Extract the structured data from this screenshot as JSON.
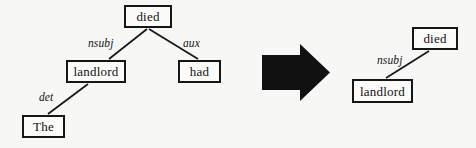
{
  "figure": {
    "type": "dependency-parse-transformation",
    "background_color": "#f7f7f5",
    "node_border_color": "#161616",
    "node_fill_color": "#fbfbf9",
    "edge_color": "#161616",
    "arrow_color": "#111111",
    "width": 476,
    "height": 148
  },
  "left_tree": {
    "caption": "full dependency tree",
    "nodes": [
      {
        "id": "died",
        "label": "died",
        "x": 124,
        "y": 5,
        "w": 48,
        "h": 23
      },
      {
        "id": "landlord",
        "label": "landlord",
        "x": 66,
        "y": 60,
        "w": 60,
        "h": 23
      },
      {
        "id": "had",
        "label": "had",
        "x": 178,
        "y": 60,
        "w": 43,
        "h": 23
      },
      {
        "id": "the",
        "label": "The",
        "x": 22,
        "y": 115,
        "w": 43,
        "h": 23
      }
    ],
    "edges": [
      {
        "from": "died",
        "to": "landlord",
        "label": "nsubj",
        "label_x": 88,
        "label_y": 38
      },
      {
        "from": "died",
        "to": "had",
        "label": "aux",
        "label_x": 183,
        "label_y": 38
      },
      {
        "from": "landlord",
        "to": "the",
        "label": "det",
        "label_x": 39,
        "label_y": 92
      }
    ]
  },
  "transform_arrow": {
    "label": "transforms-to",
    "x": 262,
    "y": 44,
    "w": 68,
    "h": 57
  },
  "right_tree": {
    "caption": "reduced dependency tree",
    "nodes": [
      {
        "id": "died",
        "label": "died",
        "x": 412,
        "y": 27,
        "w": 46,
        "h": 23
      },
      {
        "id": "landlord",
        "label": "landlord",
        "x": 352,
        "y": 79,
        "w": 61,
        "h": 24
      }
    ],
    "edges": [
      {
        "from": "died",
        "to": "landlord",
        "label": "nsubj",
        "label_x": 377,
        "label_y": 55
      }
    ]
  }
}
